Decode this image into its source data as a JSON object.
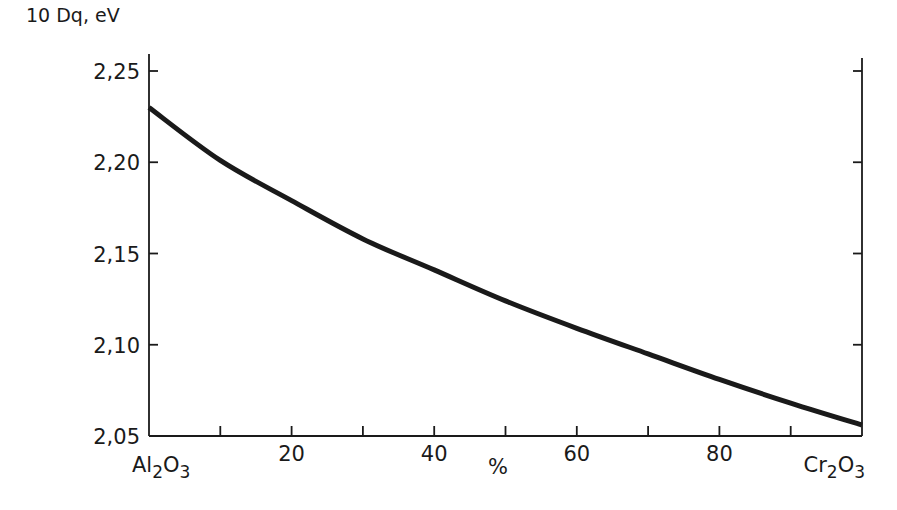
{
  "chart_data": {
    "type": "line",
    "title": "",
    "xlabel": "%",
    "ylabel": "10 Dq, eV",
    "xlim": [
      0,
      100
    ],
    "ylim": [
      2.05,
      2.25
    ],
    "x_ticks_major": [
      0,
      10,
      20,
      30,
      40,
      50,
      60,
      70,
      80,
      90,
      100
    ],
    "x_tick_labels": [
      {
        "x": 20,
        "label": "20"
      },
      {
        "x": 40,
        "label": "40"
      },
      {
        "x": 60,
        "label": "60"
      },
      {
        "x": 80,
        "label": "80"
      }
    ],
    "x_end_labels": {
      "left": {
        "base": "Al",
        "sub1": "2",
        "mid": "O",
        "sub2": "3"
      },
      "right": {
        "base": "Cr",
        "sub1": "2",
        "mid": "O",
        "sub2": "3"
      }
    },
    "y_ticks": [
      2.05,
      2.1,
      2.15,
      2.2,
      2.25
    ],
    "y_tick_labels": [
      "2,05",
      "2,10",
      "2,15",
      "2,20",
      "2,25"
    ],
    "grid": false,
    "legend": null,
    "series": [
      {
        "name": "10 Dq",
        "x": [
          0,
          10,
          20,
          30,
          40,
          50,
          60,
          70,
          80,
          90,
          100
        ],
        "y": [
          2.23,
          2.201,
          2.179,
          2.158,
          2.141,
          2.124,
          2.109,
          2.095,
          2.081,
          2.068,
          2.056
        ]
      }
    ]
  },
  "colors": {
    "ink": "#1a1a1a",
    "background": "#ffffff"
  }
}
